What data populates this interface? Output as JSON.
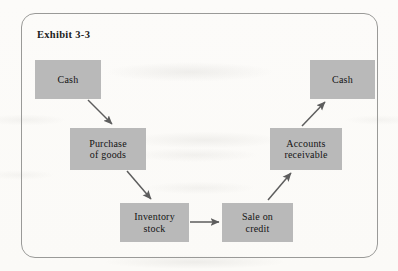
{
  "figure": {
    "exhibit_label": "Exhibit 3-3",
    "frame_border_color": "#9a9a98",
    "page_background": "#fbfaf8",
    "node_fill_color": "#b9b9b9",
    "node_text_color": "#141414",
    "arrow_color": "#5d5d5d"
  },
  "diagram": {
    "type": "flowchart",
    "nodes": [
      {
        "id": "cash-start",
        "label_line1": "Cash",
        "label_line2": ""
      },
      {
        "id": "purchase",
        "label_line1": "Purchase",
        "label_line2": "of goods"
      },
      {
        "id": "inventory",
        "label_line1": "Inventory",
        "label_line2": "stock"
      },
      {
        "id": "sale",
        "label_line1": "Sale on",
        "label_line2": "credit"
      },
      {
        "id": "receivable",
        "label_line1": "Accounts",
        "label_line2": "receivable"
      },
      {
        "id": "cash-end",
        "label_line1": "Cash",
        "label_line2": ""
      }
    ],
    "edges": [
      {
        "from": "cash-start",
        "to": "purchase",
        "direction": "down-right"
      },
      {
        "from": "purchase",
        "to": "inventory",
        "direction": "down-right"
      },
      {
        "from": "inventory",
        "to": "sale",
        "direction": "right"
      },
      {
        "from": "sale",
        "to": "receivable",
        "direction": "up-right"
      },
      {
        "from": "receivable",
        "to": "cash-end",
        "direction": "up-right"
      }
    ]
  }
}
